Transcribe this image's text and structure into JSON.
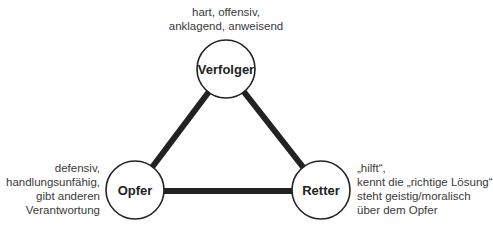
{
  "diagram": {
    "colors": {
      "line": "#222222",
      "circle_stroke": "#222222",
      "circle_fill": "#ffffff",
      "text": "#3a3a3a"
    },
    "nodes": [
      {
        "id": "verfolger",
        "label": "Verfolger",
        "cx": 226,
        "cy": 69,
        "r": 29,
        "description": [
          "hart, offensiv,",
          "anklagend, anweisend"
        ]
      },
      {
        "id": "opfer",
        "label": "Opfer",
        "cx": 135,
        "cy": 190,
        "r": 29,
        "description": [
          "defensiv,",
          "handlungsunfähig,",
          "gibt anderen",
          "Verantwortung"
        ]
      },
      {
        "id": "retter",
        "label": "Retter",
        "cx": 321,
        "cy": 190,
        "r": 29,
        "description": [
          "„hilft“,",
          "kennt die „richtige Lösung“",
          "steht geistig/moralisch",
          "über dem Opfer"
        ]
      }
    ],
    "edges": [
      {
        "from": "verfolger",
        "to": "opfer"
      },
      {
        "from": "verfolger",
        "to": "retter"
      },
      {
        "from": "opfer",
        "to": "retter"
      }
    ]
  }
}
